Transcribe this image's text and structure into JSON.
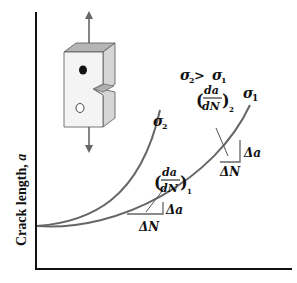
{
  "diagram": {
    "type": "fatigue crack growth curves",
    "y_axis_label": "Crack length, a",
    "x_axis_label": "",
    "condition_label": "σ₂ > σ₁",
    "curves": [
      {
        "name": "sigma1",
        "label": "σ₁",
        "slope_label": "(da/dN)₂",
        "triangle": {
          "dx_label": "ΔN",
          "dy_label": "Δa"
        }
      },
      {
        "name": "sigma2",
        "label": "σ₂"
      }
    ],
    "lower_slope": {
      "slope_label": "(da/dN)₁",
      "triangle": {
        "dx_label": "ΔN",
        "dy_label": "Δa"
      }
    },
    "specimen": {
      "description": "notched specimen under cyclic axial load",
      "arrows": "up-down"
    },
    "colors": {
      "axis": "#111111",
      "curve": "#666666",
      "specimen_top": "#b0b0b0",
      "specimen_side": "#d9d9d9",
      "specimen_front": "#f2f2f2"
    }
  },
  "text": {
    "ylabel_main": "Crack length, ",
    "ylabel_var": "a",
    "cond_s2": "σ",
    "cond_sub2": "2",
    "cond_gt": " > ",
    "cond_s1": "σ",
    "cond_sub1": "1",
    "sigma": "σ",
    "sub1": "1",
    "sub2": "2",
    "da": "da",
    "dN": "dN",
    "delta_a": "Δa",
    "delta_N": "ΔN"
  }
}
